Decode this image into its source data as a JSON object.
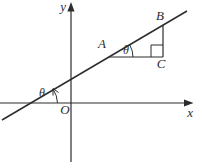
{
  "diagram": {
    "labels": {
      "y_axis": "y",
      "x_axis": "x",
      "origin": "O",
      "point_a": "A",
      "point_b": "B",
      "point_c": "C",
      "angle_at_origin": "θ",
      "angle_at_a": "θ"
    },
    "colors": {
      "stroke": "#2d2d2d",
      "background": "#ffffff"
    }
  }
}
